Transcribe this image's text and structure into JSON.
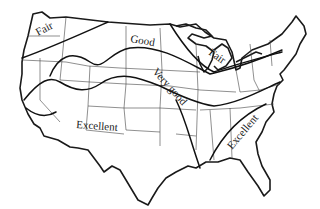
{
  "map": {
    "subject": "Continental United States",
    "style": "black-and-white line map with quality contour zones",
    "colors": {
      "ink": "#1a1a1a",
      "background": "#ffffff"
    },
    "regions": [
      {
        "id": "fair-northwest",
        "label": "Fair",
        "x": 44,
        "y": 33,
        "rotate": -28
      },
      {
        "id": "good-north",
        "label": "Good",
        "x": 140,
        "y": 46,
        "rotate": 10
      },
      {
        "id": "fair-great-lakes",
        "label": "Fair",
        "x": 214,
        "y": 62,
        "rotate": 35
      },
      {
        "id": "very-good-band",
        "label": "Very good",
        "x": 148,
        "y": 82,
        "rotate": 48
      },
      {
        "id": "excellent-southwest",
        "label": "Excellent",
        "x": 78,
        "y": 128,
        "rotate": 4
      },
      {
        "id": "excellent-southeast",
        "label": "Excellent",
        "x": 242,
        "y": 148,
        "rotate": -50
      }
    ]
  }
}
